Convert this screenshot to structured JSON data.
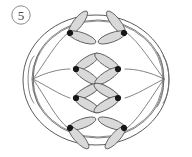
{
  "figure": {
    "name": "cell-division-anaphase-diagram",
    "step_label": "5",
    "caption": "",
    "colors": {
      "background": "#ffffff",
      "membrane_stroke": "#5a5a5a",
      "spindle_stroke": "#6e6e6e",
      "chromatid_fill": "#d9d9d9",
      "chromatid_stroke": "#5f5f5f",
      "centromere_fill": "#161616",
      "label_text": "#4a4a4a",
      "label_ring": "#8a8a8a"
    },
    "cell": {
      "outer_membrane": {
        "cx": 96,
        "cy": 80,
        "rx": 73,
        "ry": 65
      },
      "inner_membrane": {
        "cx": 98,
        "cy": 79,
        "rx": 66,
        "ry": 59
      }
    },
    "poles": [
      {
        "name": "left-pole",
        "x": 33,
        "y": 79
      },
      {
        "name": "right-pole",
        "x": 164,
        "y": 79
      }
    ],
    "chromosome_count": 8,
    "chromosomes": [
      {
        "name": "chromatid-left-1",
        "side": "left",
        "cx": 70,
        "cy": 33,
        "rotation": -22
      },
      {
        "name": "chromatid-left-2",
        "side": "left",
        "cx": 76,
        "cy": 69,
        "rotation": 0
      },
      {
        "name": "chromatid-left-3",
        "side": "left",
        "cx": 76,
        "cy": 98,
        "rotation": 0
      },
      {
        "name": "chromatid-left-4",
        "side": "left",
        "cx": 70,
        "cy": 128,
        "rotation": 20
      },
      {
        "name": "chromatid-right-1",
        "side": "right",
        "cx": 124,
        "cy": 33,
        "rotation": 22
      },
      {
        "name": "chromatid-right-2",
        "side": "right",
        "cx": 118,
        "cy": 69,
        "rotation": 0
      },
      {
        "name": "chromatid-right-3",
        "side": "right",
        "cx": 118,
        "cy": 98,
        "rotation": 0
      },
      {
        "name": "chromatid-right-4",
        "side": "right",
        "cx": 124,
        "cy": 128,
        "rotation": -20
      }
    ],
    "spindle_fibers": 8
  }
}
